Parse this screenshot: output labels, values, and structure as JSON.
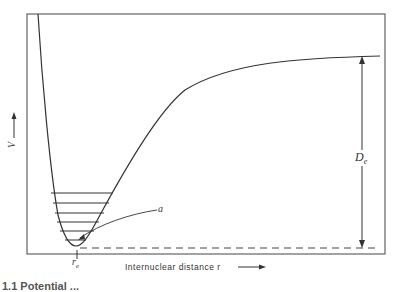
{
  "diagram": {
    "y_axis_label": "V",
    "y_axis_arrow": "→",
    "x_axis_label": "Internuclear distance r",
    "x_axis_arrow": "⟶",
    "equilibrium_label": "r",
    "equilibrium_subscript": "e",
    "dissociation_label": "D",
    "dissociation_subscript": "e",
    "annotation_label": "a",
    "vibrational_levels_count": 6,
    "caption_partial": "1.1  Potential ...",
    "colors": {
      "line": "#333333",
      "background": "#ffffff"
    }
  }
}
